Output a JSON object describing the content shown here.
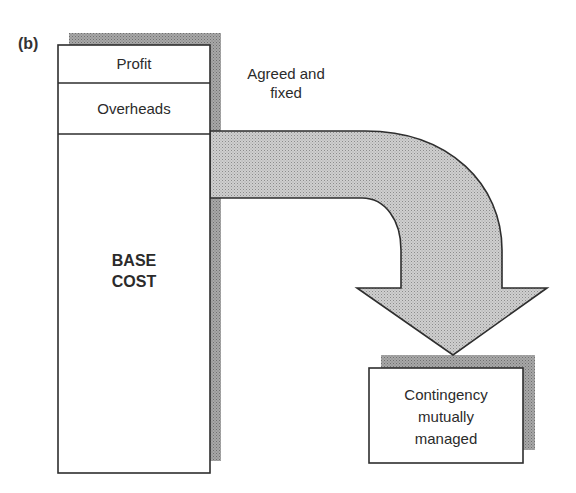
{
  "figure": {
    "panel_label": "(b)"
  },
  "column": {
    "segments": [
      {
        "label": "Profit"
      },
      {
        "label": "Overheads"
      },
      {
        "label_line1": "BASE",
        "label_line2": "COST"
      }
    ]
  },
  "arrow": {
    "annotation_line1": "Agreed and",
    "annotation_line2": "fixed"
  },
  "target_box": {
    "line1": "Contingency",
    "line2": "mutually",
    "line3": "managed"
  },
  "colors": {
    "shadow": "#9a9a9a",
    "arrow_fill": "#c4c4c4",
    "stroke": "#2e2e2e"
  }
}
